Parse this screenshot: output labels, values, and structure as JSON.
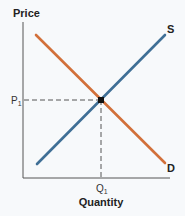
{
  "diagram": {
    "type": "supply-demand",
    "y_axis": {
      "title": "Price",
      "tick_label": "P",
      "tick_subscript": "1"
    },
    "x_axis": {
      "title": "Quantity",
      "tick_label": "Q",
      "tick_subscript": "1"
    },
    "curves": [
      {
        "name": "supply",
        "label": "S",
        "color": "#3f6f96",
        "slope": "upward"
      },
      {
        "name": "demand",
        "label": "D",
        "color": "#d2703a",
        "slope": "downward"
      }
    ],
    "equilibrium": {
      "price_label": "P1",
      "quantity_label": "Q1",
      "marker_color": "#111111"
    },
    "colors": {
      "background": "#f7f9fb",
      "axis": "#555555",
      "guide_lines": "#555555"
    }
  }
}
